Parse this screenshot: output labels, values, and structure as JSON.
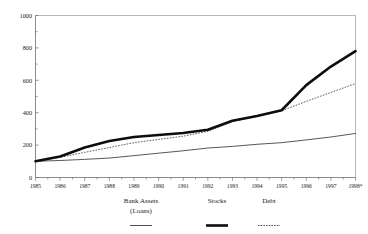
{
  "figure": {
    "cut_off_title": "",
    "note_marker": "*"
  },
  "chart_data": {
    "type": "line",
    "title": "",
    "xlabel": "",
    "ylabel": "",
    "grid": false,
    "legend_position": "bottom",
    "ylim": [
      0,
      1000
    ],
    "yticks": [
      0,
      200,
      400,
      600,
      800,
      1000
    ],
    "ytick_labels": [
      "0",
      "200",
      "400",
      "600",
      "800",
      "1000"
    ],
    "categories": [
      "1985",
      "1986",
      "1987",
      "1988",
      "1989",
      "1990",
      "1991",
      "1992",
      "1993",
      "1994",
      "1995",
      "1996",
      "1997",
      "1998*"
    ],
    "x": [
      1985,
      1986,
      1987,
      1988,
      1989,
      1990,
      1991,
      1992,
      1993,
      1994,
      1995,
      1996,
      1997,
      1998
    ],
    "series": [
      {
        "name": "Bank Assets (Loans)",
        "legend_label_line1": "Bank Assets",
        "legend_label_line2": "(Loans)",
        "style": "thin-solid",
        "color": "#3a3a3a",
        "values": [
          100,
          105,
          112,
          120,
          135,
          150,
          165,
          182,
          192,
          205,
          215,
          232,
          250,
          272
        ]
      },
      {
        "name": "Stocks",
        "legend_label_line1": "Stocks",
        "legend_label_line2": "",
        "style": "thick-solid",
        "color": "#0d0d0d",
        "values": [
          100,
          130,
          185,
          225,
          250,
          262,
          275,
          295,
          350,
          380,
          415,
          570,
          685,
          780
        ]
      },
      {
        "name": "Debt",
        "legend_label_line1": "Debt",
        "legend_label_line2": "",
        "style": "dotted",
        "color": "#4a4a4a",
        "values": [
          100,
          125,
          155,
          185,
          215,
          235,
          255,
          285,
          345,
          378,
          412,
          470,
          525,
          580
        ]
      }
    ]
  }
}
